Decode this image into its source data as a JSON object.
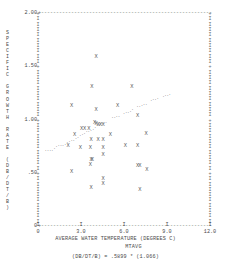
{
  "chart_data": {
    "type": "scatter",
    "title": "",
    "xlabel": "AVERAGE WATER TEMPERATURE (DEGREES C)",
    "xlabel_sub": "MTAVG",
    "ylabel": "SPECIFIC GROWTH RATE (DB/DT/B)",
    "equation": "(DB/DT/B) = .5899 * (1.066)",
    "xlim": [
      0,
      12.0
    ],
    "ylim": [
      0,
      2.0
    ],
    "xticks": [
      "0",
      "3.0",
      "6.0",
      "9.0",
      "12.0"
    ],
    "xtick_values": [
      0,
      3.0,
      6.0,
      9.0,
      12.0
    ],
    "yticks": [
      "2.00",
      "1.50",
      "1.00",
      ".50",
      "0"
    ],
    "ytick_values": [
      2.0,
      1.5,
      1.0,
      0.5,
      0.0
    ],
    "grid": false,
    "legend": "none",
    "marker": "X",
    "fit_marker": ".",
    "series": [
      {
        "name": "observations",
        "marker": "X",
        "points": [
          [
            4.05,
            1.58
          ],
          [
            3.75,
            1.3
          ],
          [
            6.55,
            1.3
          ],
          [
            2.35,
            1.12
          ],
          [
            5.55,
            1.12
          ],
          [
            4.05,
            1.08
          ],
          [
            6.95,
            1.02
          ],
          [
            3.95,
            0.96
          ],
          [
            4.05,
            0.95
          ],
          [
            3.05,
            0.905
          ],
          [
            3.25,
            0.905
          ],
          [
            3.55,
            0.9
          ],
          [
            2.55,
            0.845
          ],
          [
            4.2,
            0.94
          ],
          [
            4.35,
            0.935
          ],
          [
            4.55,
            0.935
          ],
          [
            7.55,
            0.855
          ],
          [
            5.05,
            0.845
          ],
          [
            3.7,
            0.8
          ],
          [
            4.2,
            0.8
          ],
          [
            4.55,
            0.8
          ],
          [
            2.1,
            0.745
          ],
          [
            6.1,
            0.745
          ],
          [
            6.95,
            0.745
          ],
          [
            2.95,
            0.72
          ],
          [
            3.65,
            0.72
          ],
          [
            4.55,
            0.72
          ],
          [
            4.55,
            0.655
          ],
          [
            3.7,
            0.615
          ],
          [
            3.8,
            0.615
          ],
          [
            3.65,
            0.565
          ],
          [
            6.95,
            0.555
          ],
          [
            7.1,
            0.555
          ],
          [
            7.6,
            0.515
          ],
          [
            2.35,
            0.495
          ],
          [
            4.55,
            0.43
          ],
          [
            4.55,
            0.385
          ],
          [
            3.7,
            0.345
          ],
          [
            7.1,
            0.33
          ]
        ]
      },
      {
        "name": "fitted-exponential-curve",
        "marker": ".",
        "points": [
          [
            0.55,
            0.7
          ],
          [
            0.7,
            0.7
          ],
          [
            0.85,
            0.7
          ],
          [
            1.0,
            0.7
          ],
          [
            1.15,
            0.72
          ],
          [
            1.3,
            0.745
          ],
          [
            1.45,
            0.755
          ],
          [
            1.6,
            0.755
          ],
          [
            1.75,
            0.755
          ],
          [
            1.9,
            0.765
          ],
          [
            2.05,
            0.775
          ],
          [
            2.2,
            0.79
          ],
          [
            2.35,
            0.8
          ],
          [
            2.5,
            0.8
          ],
          [
            2.65,
            0.815
          ],
          [
            2.8,
            0.825
          ],
          [
            2.95,
            0.845
          ],
          [
            3.1,
            0.855
          ],
          [
            3.25,
            0.865
          ],
          [
            3.4,
            0.88
          ],
          [
            3.55,
            0.885
          ],
          [
            3.7,
            0.895
          ],
          [
            3.85,
            0.905
          ],
          [
            4.0,
            0.92
          ],
          [
            4.15,
            0.935
          ],
          [
            4.3,
            0.945
          ],
          [
            4.45,
            0.955
          ],
          [
            4.6,
            0.955
          ],
          [
            4.75,
            0.965
          ],
          [
            5.2,
            1.01
          ],
          [
            5.35,
            1.01
          ],
          [
            5.5,
            1.02
          ],
          [
            5.65,
            1.02
          ],
          [
            6.0,
            1.055
          ],
          [
            6.15,
            1.06
          ],
          [
            6.3,
            1.065
          ],
          [
            6.45,
            1.075
          ],
          [
            6.6,
            1.085
          ],
          [
            6.95,
            1.115
          ],
          [
            7.1,
            1.12
          ],
          [
            7.25,
            1.125
          ],
          [
            7.4,
            1.135
          ],
          [
            7.55,
            1.14
          ],
          [
            7.9,
            1.175
          ],
          [
            8.05,
            1.18
          ],
          [
            8.2,
            1.185
          ],
          [
            8.35,
            1.19
          ],
          [
            8.75,
            1.215
          ],
          [
            8.9,
            1.22
          ],
          [
            9.05,
            1.225
          ],
          [
            9.2,
            1.23
          ]
        ]
      }
    ]
  }
}
